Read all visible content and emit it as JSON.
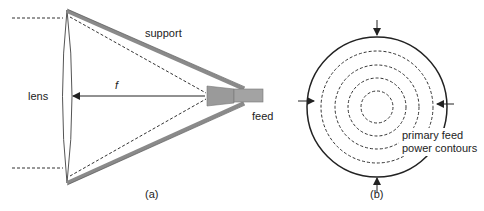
{
  "figure_a": {
    "caption": "(a)",
    "labels": {
      "lens": "lens",
      "support": "support",
      "focal_length": "f",
      "feed": "feed"
    }
  },
  "figure_b": {
    "caption": "(b)",
    "labels": {
      "contours_line1": "primary feed",
      "contours_line2": "power contours"
    }
  },
  "colors": {
    "line": "#222222",
    "support": "#8a8a8a",
    "feed": "#9a9a9a"
  }
}
